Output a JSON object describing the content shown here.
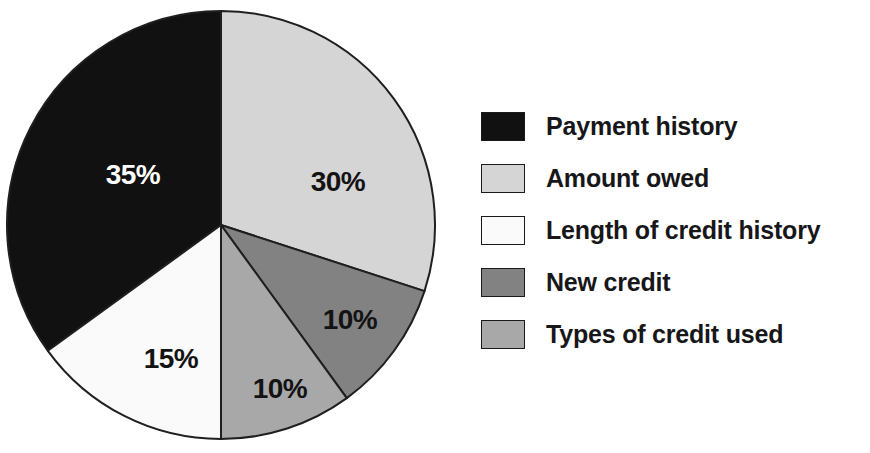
{
  "chart_data": {
    "type": "pie",
    "title": "",
    "subtitle": "",
    "xlabel": "",
    "ylabel": "",
    "grid": false,
    "legend_position": "right",
    "start_angle_deg": 0,
    "direction": "clockwise",
    "categories": [
      "Payment history",
      "Amount owed",
      "Length of credit history",
      "New credit",
      "Types of credit used"
    ],
    "values": [
      35,
      30,
      15,
      10,
      10
    ],
    "value_unit": "%",
    "slice_labels": [
      "35%",
      "30%",
      "15%",
      "10%",
      "10%"
    ],
    "colors": [
      "#111111",
      "#d5d5d5",
      "#fafafa",
      "#828282",
      "#a8a8a8"
    ],
    "slices": [
      {
        "label": "Payment history",
        "value": 35,
        "display": "35%",
        "color": "#111111",
        "label_color": "#ffffff",
        "start_deg": 234,
        "end_deg": 360,
        "label_x": 128,
        "label_y": 168
      },
      {
        "label": "Amount owed",
        "value": 30,
        "display": "30%",
        "color": "#d5d5d5",
        "label_color": "#131313",
        "start_deg": 0,
        "end_deg": 108,
        "label_x": 333,
        "label_y": 175
      },
      {
        "label": "Length of credit history",
        "value": 15,
        "display": "15%",
        "color": "#fafafa",
        "label_color": "#131313",
        "start_deg": 180,
        "end_deg": 234,
        "label_x": 166,
        "label_y": 352
      },
      {
        "label": "New credit",
        "value": 10,
        "display": "10%",
        "color": "#828282",
        "label_color": "#131313",
        "start_deg": 108,
        "end_deg": 144,
        "label_x": 345,
        "label_y": 313
      },
      {
        "label": "Types of credit used",
        "value": 10,
        "display": "10%",
        "color": "#a8a8a8",
        "label_color": "#131313",
        "start_deg": 144,
        "end_deg": 180,
        "label_x": 275,
        "label_y": 382
      }
    ],
    "outline_color": "#1f1f1f"
  },
  "pie": {
    "center_x": 216,
    "center_y": 216,
    "radius": 214
  },
  "legend": {
    "items": [
      {
        "label": "Payment history",
        "color": "#111111"
      },
      {
        "label": "Amount owed",
        "color": "#d5d5d5"
      },
      {
        "label": "Length of credit history",
        "color": "#fafafa"
      },
      {
        "label": "New credit",
        "color": "#828282"
      },
      {
        "label": "Types of credit used",
        "color": "#a8a8a8"
      }
    ]
  }
}
